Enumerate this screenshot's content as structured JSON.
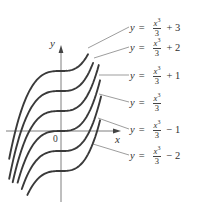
{
  "figure": {
    "axes": {
      "x_label": "x",
      "y_label": "y",
      "origin_label": "0",
      "origin_px": [
        61,
        131
      ]
    },
    "curve_family": "y = x^3/3 + C",
    "curves": [
      {
        "C": 3,
        "label_var": "y",
        "label_eq": "=",
        "num": "x",
        "exp": "3",
        "den": "3",
        "tail": "+ 3",
        "t_min": -3.7,
        "t_max": 1.93,
        "leader_from": [
          88,
          48
        ],
        "leader_to": [
          129,
          27
        ],
        "label_top": 16
      },
      {
        "C": 2,
        "label_var": "y",
        "label_eq": "=",
        "num": "x",
        "exp": "3",
        "den": "3",
        "tail": "+ 2",
        "t_min": -3.7,
        "t_max": 2.29,
        "leader_from": [
          94,
          58
        ],
        "leader_to": [
          129,
          47
        ],
        "label_top": 36
      },
      {
        "C": 1,
        "label_var": "y",
        "label_eq": "=",
        "num": "x",
        "exp": "3",
        "den": "3",
        "tail": "+ 1",
        "t_min": -3.45,
        "t_max": 2.7,
        "leader_from": [
          99,
          75
        ],
        "leader_to": [
          129,
          75
        ],
        "label_top": 64
      },
      {
        "C": 0,
        "label_var": "y",
        "label_eq": "=",
        "num": "x",
        "exp": "3",
        "den": "3",
        "tail": "",
        "t_min": -3.1,
        "t_max": 2.79,
        "leader_from": [
          99,
          94
        ],
        "leader_to": [
          129,
          102
        ],
        "label_top": 91
      },
      {
        "C": -1,
        "label_var": "y",
        "label_eq": "=",
        "num": "x",
        "exp": "3",
        "den": "3",
        "tail": "− 1",
        "t_min": -2.8,
        "t_max": 2.86,
        "leader_from": [
          98,
          118
        ],
        "leader_to": [
          129,
          129
        ],
        "label_top": 118
      },
      {
        "C": -2,
        "label_var": "y",
        "label_eq": "=",
        "num": "x",
        "exp": "3",
        "den": "3",
        "tail": "− 2",
        "t_min": -2.4,
        "t_max": 2.79,
        "leader_from": [
          93,
          144
        ],
        "leader_to": [
          129,
          155
        ],
        "label_top": 144
      }
    ],
    "colors": {
      "curve": "#3a3a3a",
      "axis": "#6f6f6f",
      "text": "#2f2f2f"
    }
  }
}
